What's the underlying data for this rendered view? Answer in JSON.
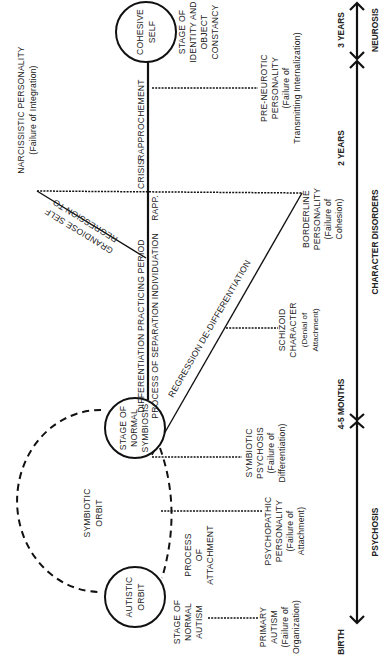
{
  "diagram": {
    "orientation": "rotated-90-ccw",
    "nodes": {
      "cohesive_self": [
        "COHESIVE",
        "SELF"
      ],
      "normal_symbiosis": [
        "STAGE OF",
        "NORMAL",
        "SYMBIOSIS"
      ],
      "autistic_orbit": [
        "AUTISTIC",
        "ORBIT"
      ],
      "symbiotic_orbit": [
        "SYMBIOTIC",
        "ORBIT"
      ]
    },
    "stages": {
      "identity_constancy": [
        "STAGE OF",
        "IDENTITY AND",
        "OBJECT",
        "CONSTANCY"
      ],
      "normal_autism": [
        "STAGE OF",
        "NORMAL",
        "AUTISM"
      ],
      "process_attachment": [
        "PROCESS",
        "OF",
        "ATTACHMENT"
      ]
    },
    "spine": {
      "rapprochement": "RAPPROCHEMENT",
      "rapp": "RAPP.",
      "crisis": "CRISIS",
      "differentiation_practicing": "DIFFERENTIATION PRACTICING PERIOD",
      "process_separation": "PROCESS OF SEPARATION  INDIVIDUATION"
    },
    "regressions": {
      "grandiose_self": [
        "REGRESSION TO",
        "GRANDIOSE SELF"
      ],
      "dedifferentiation": "REGRESSION DE-DIFFERENTIATION"
    },
    "disorders": {
      "narcissistic": [
        "NARCISSISTIC PERSONALITY",
        "(Failure of Integration)"
      ],
      "pre_neurotic": [
        "PRE-NEUROTIC",
        "PERSONALITY",
        "(Failure of",
        "Transmitting Internalization)"
      ],
      "borderline": [
        "BORDERLINE",
        "PERSONALITY",
        "(Failure of",
        "Cohesion)"
      ],
      "schizoid": [
        "SCHIZOID",
        "CHARACTER",
        "(Denial of",
        "Attachment)"
      ],
      "symbiotic_psychosis": [
        "SYMBIOTIC",
        "PSYCHOSIS",
        "(Failure of",
        "Differentiation)"
      ],
      "psychopathic": [
        "PSYCHOPATHIC",
        "PERSONALITY",
        "(Failure of",
        "Attachment)"
      ],
      "primary_autism": [
        "PRIMARY",
        "AUTISM",
        "(Failure of",
        "Organization)"
      ]
    },
    "timeline": {
      "ages": {
        "three_years": "3 YEARS",
        "two_years": "2 YEARS",
        "four_five_months": "4-5 MONTHS",
        "birth": "BIRTH"
      },
      "categories": {
        "neurosis": "NEUROSIS",
        "character_disorders": "CHARACTER DISORDERS",
        "psychosis": "PSYCHOSIS"
      }
    }
  }
}
